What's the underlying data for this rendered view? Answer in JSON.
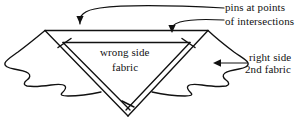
{
  "figure": {
    "type": "sewing-diagram",
    "background_color": "#ffffff",
    "line_color": "#111111"
  },
  "labels": {
    "pins_line1": "pins at points",
    "pins_line2": "of intersections",
    "right_side_line1": "right side",
    "right_side_line2": "2nd fabric",
    "wrong_side_line1": "wrong side",
    "wrong_side_line2": "fabric"
  },
  "annotations": [
    {
      "name": "pins-at-points-of-intersections",
      "text": "pins at points of intersections",
      "leader": "two curved arrows pointing down to the two upper intersection points"
    },
    {
      "name": "right-side-2nd-fabric",
      "text": "right side 2nd fabric",
      "leader": "straight arrow pointing left into the second fabric layer"
    },
    {
      "name": "wrong-side-fabric",
      "text": "wrong side fabric",
      "leader": "none"
    }
  ],
  "markers": {
    "pin_ticks": 3,
    "pin_tick_description": "short perpendicular strokes marking pin positions on the folded edges"
  }
}
